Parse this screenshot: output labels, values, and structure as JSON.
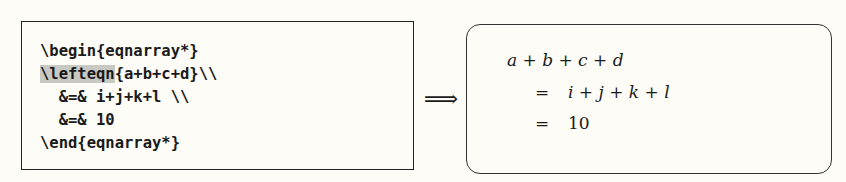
{
  "source": {
    "lines": [
      {
        "pre": "",
        "highlight": "",
        "text": "\\begin{eqnarray*}"
      },
      {
        "pre": "",
        "highlight": "\\lefteqn",
        "text": "{a+b+c+d}\\\\"
      },
      {
        "pre": "  ",
        "highlight": "",
        "text": "&=& i+j+k+l \\\\"
      },
      {
        "pre": "  ",
        "highlight": "",
        "text": "&=& 10"
      },
      {
        "pre": "",
        "highlight": "",
        "text": "\\end{eqnarray*}"
      }
    ]
  },
  "arrow": "⟹",
  "result": {
    "line1": "a + b + c + d",
    "rows": [
      {
        "rel": "=",
        "rhs": "i + j + k + l"
      },
      {
        "rel": "=",
        "rhs": "10"
      }
    ]
  }
}
